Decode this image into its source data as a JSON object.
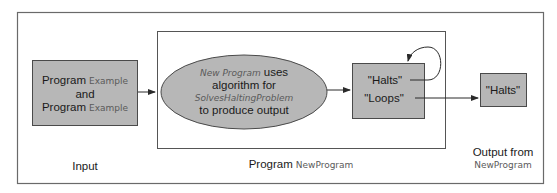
{
  "colors": {
    "box_fill": "#b7b7b7",
    "ellipse_fill": "#b7b7b7",
    "stroke": "#4a4a4a",
    "frame_stroke": "#6a6a6a"
  },
  "input_box": {
    "line1_main": "Program",
    "line1_alt": "Example",
    "line2": "and",
    "line3_main": "Program",
    "line3_alt": "Example"
  },
  "ellipse": {
    "line1_alt": "New Program",
    "line1_main": "uses",
    "line2": "algorithm for",
    "line3_alt": "SolvesHaltingProblem",
    "line4": "to produce output"
  },
  "decision_box": {
    "halts": "\"Halts\"",
    "loops": "\"Loops\""
  },
  "output_box": {
    "text": "\"Halts\""
  },
  "labels": {
    "input": "Input",
    "program_main": "Program",
    "program_alt": "NewProgram",
    "output_line1": "Output from",
    "output_line2": "NewProgram"
  }
}
